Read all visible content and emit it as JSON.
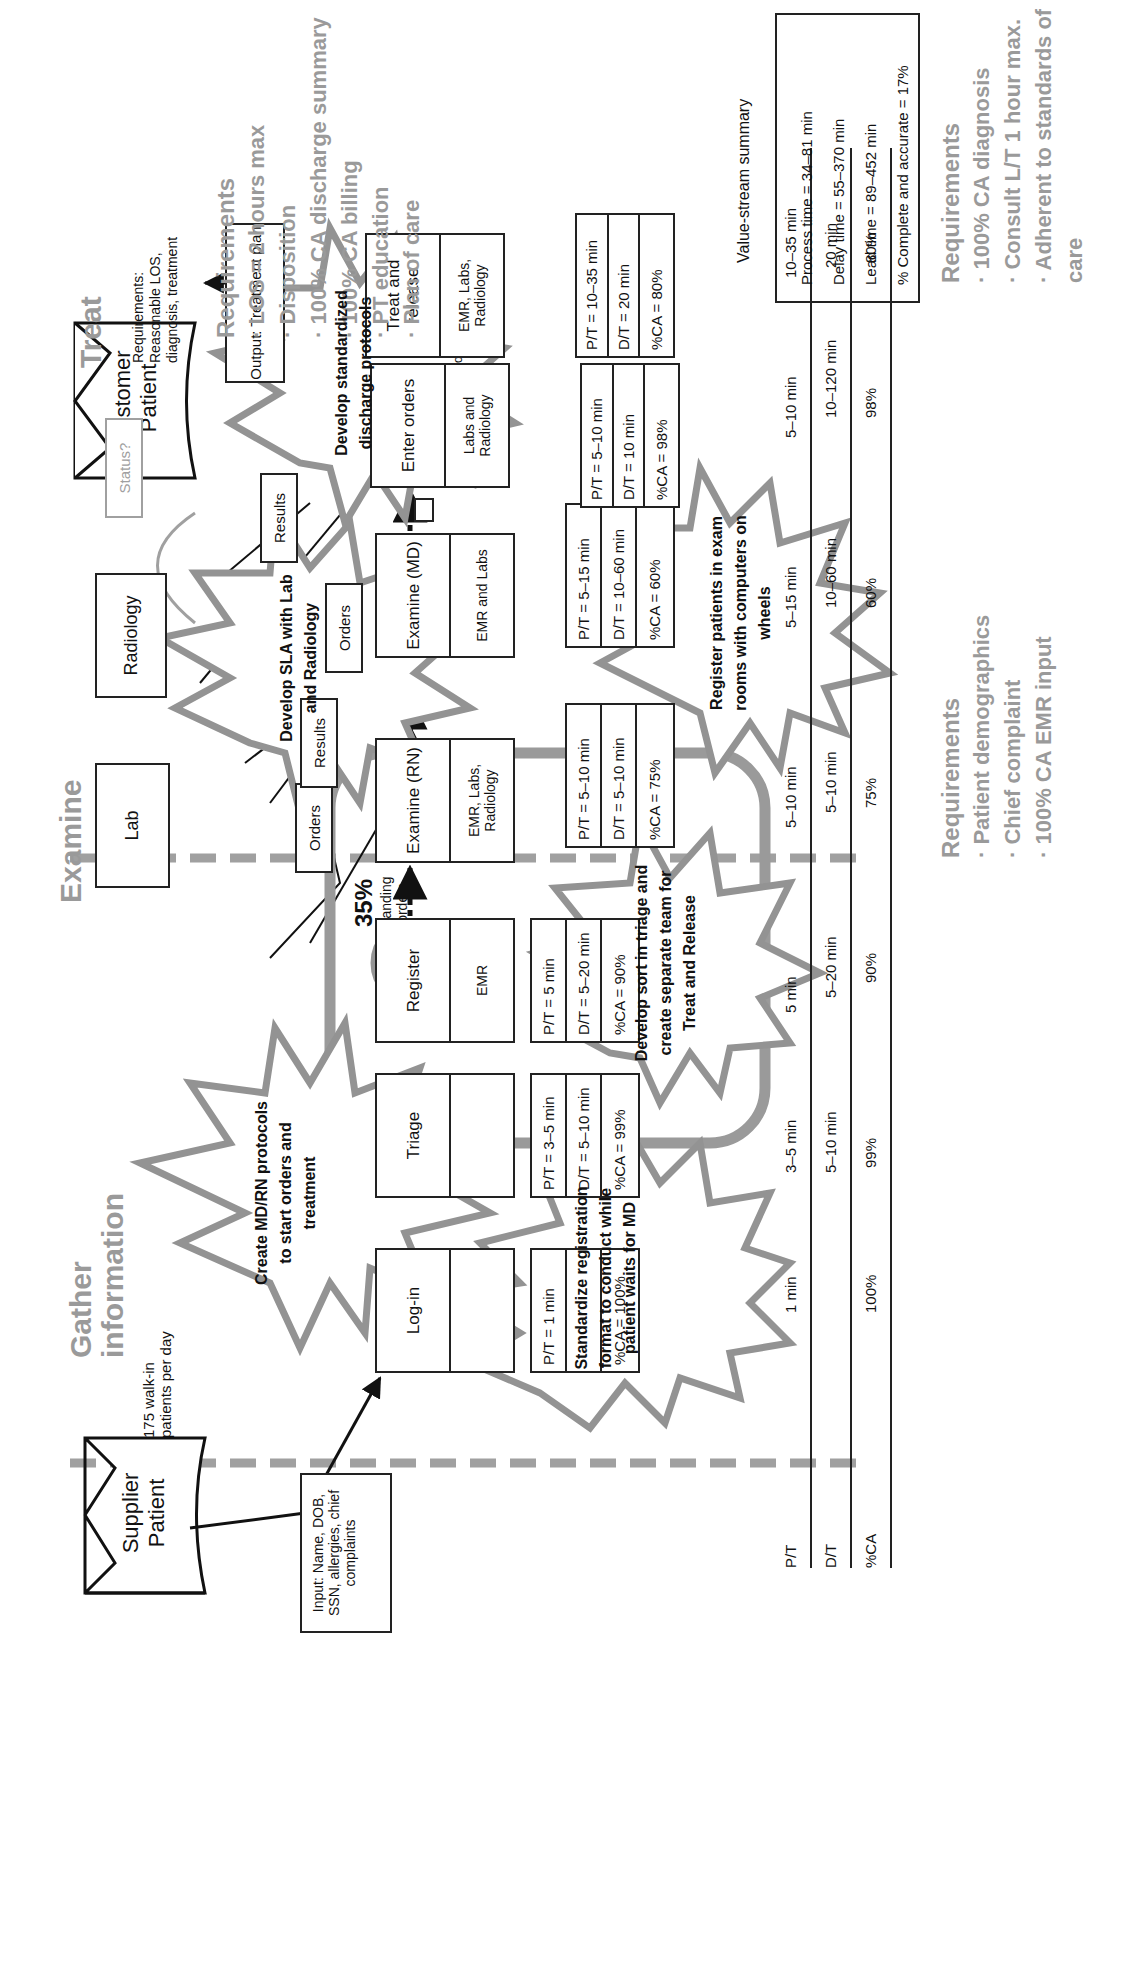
{
  "phases": {
    "gather": "Gather information",
    "examine": "Examine",
    "treat": "Treat"
  },
  "supplier": {
    "line1": "Supplier",
    "line2": "Patient"
  },
  "customer": {
    "line1": "Customer",
    "line2": "Patient"
  },
  "walkins": "175 walk-in patients per day",
  "input_box": "Input: Name, DOB, SSN, allergies, chief complaints",
  "treat_small_req": "Requirements: Reasonable LOS, diagnosis, treatment",
  "standing_orders": {
    "pct": "35%",
    "label": "standing orders"
  },
  "wait_room": {
    "label": "Waiting Room",
    "time": "0–2 hours"
  },
  "treat_wait": {
    "time": "0–2",
    "unit": "hours"
  },
  "external": {
    "lab": "Lab",
    "radiology": "Radiology",
    "status": "Status?"
  },
  "flows": {
    "orders1": "Orders",
    "orders2": "Orders",
    "results1": "Results",
    "results2": "Results",
    "output": "Output: Treatment plan"
  },
  "processes": [
    {
      "name": "Log-in",
      "system": "",
      "pt": "P/T = 1 min",
      "dt": "",
      "ca": "%CA = 100%"
    },
    {
      "name": "Triage",
      "system": "",
      "pt": "P/T = 3–5 min",
      "dt": "D/T = 5–10 min",
      "ca": "%CA = 99%"
    },
    {
      "name": "Register",
      "system": "EMR",
      "pt": "P/T = 5 min",
      "dt": "D/T = 5–20 min",
      "ca": "%CA = 90%"
    },
    {
      "name": "Examine (RN)",
      "system": "EMR, Labs, Radiology",
      "pt": "P/T = 5–10 min",
      "dt": "D/T = 5–10 min",
      "ca": "%CA = 75%"
    },
    {
      "name": "Examine (MD)",
      "system": "EMR and Labs",
      "pt": "P/T = 5–15 min",
      "dt": "D/T = 10–60 min",
      "ca": "%CA = 60%"
    },
    {
      "name": "Enter orders",
      "system": "Labs and Radiology",
      "pt": "P/T = 5–10 min",
      "dt": "D/T = 10 min",
      "ca": "%CA = 98%"
    },
    {
      "name": "Treat and release",
      "system": "EMR, Labs, Radiology",
      "pt": "P/T = 10–35 min",
      "dt": "D/T = 20 min",
      "ca": "%CA = 80%"
    }
  ],
  "timeline": {
    "row_labels": [
      "P/T",
      "D/T",
      "%CA"
    ],
    "pt": [
      "1 min",
      "3–5 min",
      "5 min",
      "5–10 min",
      "5–15 min",
      "5–10 min",
      "10–35 min"
    ],
    "dt": [
      "5–10 min",
      "5–20 min",
      "5–10 min",
      "10–60 min",
      "10–120 min",
      "20 min"
    ],
    "ca": [
      "100%",
      "99%",
      "90%",
      "75%",
      "60%",
      "98%",
      "80%"
    ]
  },
  "summary": {
    "title": "Value-stream summary",
    "process": "Process time = 34–81 min",
    "delay": "Delay time = 55–370 min",
    "lead": "Lead time = 89–452 min",
    "ca": "% Complete and accurate = 17%"
  },
  "requirements": {
    "gather": {
      "title": "Requirements",
      "items": [
        "· Patient demographics",
        "· Chief complaint",
        "· 100% CA EMR input"
      ]
    },
    "examine": {
      "title": "Requirements",
      "items": [
        "· 100% CA diagnosis",
        "· Consult L/T 1 hour max.",
        "· Adherent to standards of care"
      ]
    },
    "treat": {
      "title": "Requirements",
      "items": [
        "· LOS = 2 hours max",
        "· Disposition",
        "· 100% CA discharge summary",
        "· 100% CA billing",
        "· PT education",
        "· Plan of care"
      ]
    }
  },
  "kaizen_bursts": [
    "Create MD/RN protocols to start orders and treatment",
    "Standardize registration format to conduct while patient waits for MD",
    "Develop sort in triage and create separate team for Treat and Release",
    "Develop SLA with Lab and Radiology",
    "Register patients in exam rooms with computers on wheels",
    "Develop standardized discharge protocols"
  ],
  "colors": {
    "line": "#222222",
    "gray": "#9a9a9a",
    "burst": "#8f8f8f"
  }
}
